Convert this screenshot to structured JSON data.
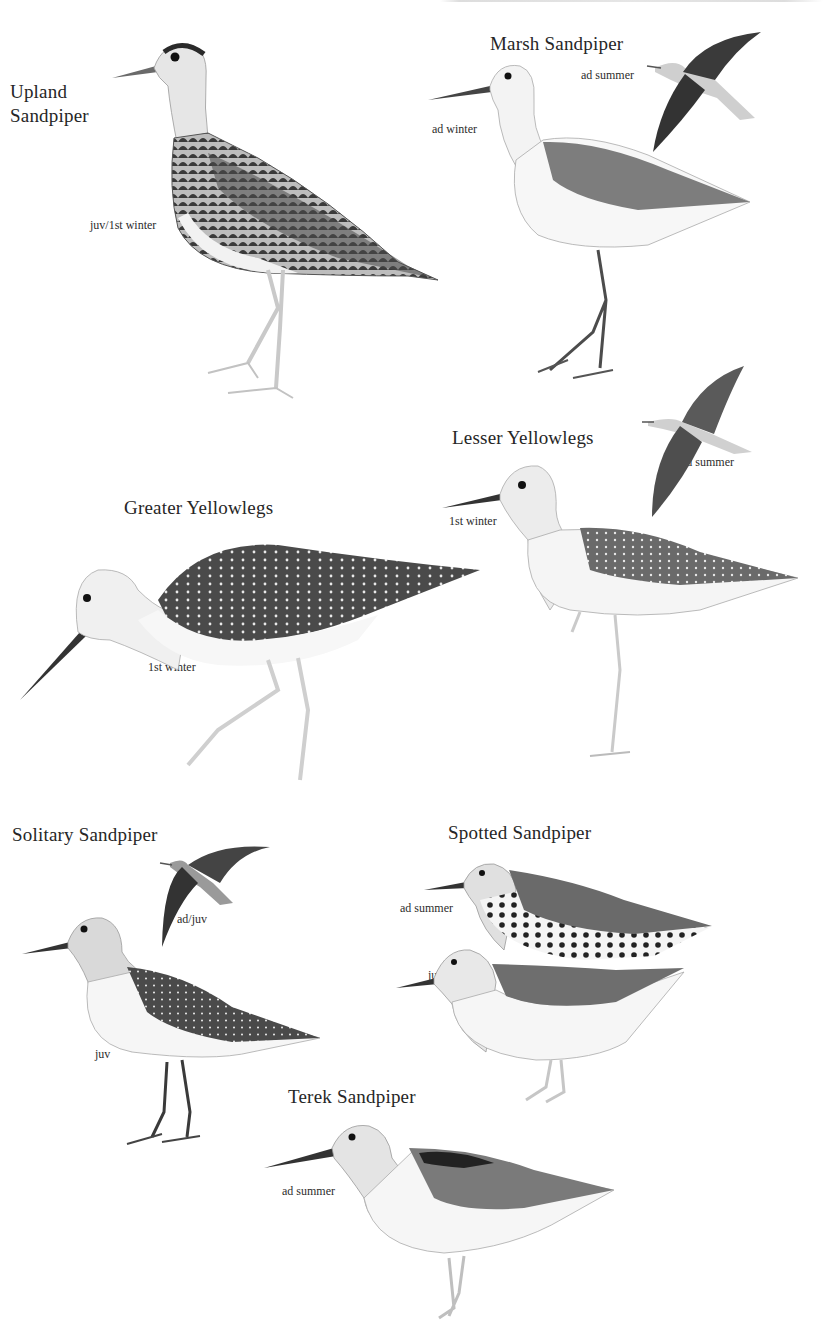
{
  "plate": {
    "background": "#ffffff",
    "ink_color": "#262626",
    "header_text_cropped": true
  },
  "species": [
    {
      "id": "upland",
      "name_line1": "Upland",
      "name_line2": "Sandpiper",
      "plumages": [
        {
          "label": "juv/1st winter"
        }
      ]
    },
    {
      "id": "marsh",
      "name": "Marsh Sandpiper",
      "plumages": [
        {
          "label": "ad winter"
        },
        {
          "label": "ad summer"
        }
      ]
    },
    {
      "id": "lesser-yellowlegs",
      "name": "Lesser Yellowlegs",
      "plumages": [
        {
          "label": "1st winter"
        },
        {
          "label": "ad summer"
        }
      ]
    },
    {
      "id": "greater-yellowlegs",
      "name": "Greater Yellowlegs",
      "plumages": [
        {
          "label": "1st winter"
        }
      ]
    },
    {
      "id": "solitary",
      "name": "Solitary Sandpiper",
      "plumages": [
        {
          "label": "ad/juv"
        },
        {
          "label": "juv"
        }
      ]
    },
    {
      "id": "spotted",
      "name": "Spotted Sandpiper",
      "plumages": [
        {
          "label": "ad summer"
        },
        {
          "label": "juv"
        }
      ]
    },
    {
      "id": "terek",
      "name": "Terek Sandpiper",
      "plumages": [
        {
          "label": "ad summer"
        }
      ]
    }
  ]
}
